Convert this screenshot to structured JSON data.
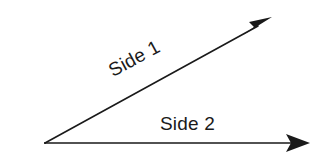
{
  "figure": {
    "type": "geometry-diagram",
    "background_color": "#ffffff",
    "stroke_color": "#1a1a1a",
    "text_color": "#1a1a1a"
  },
  "labels": {
    "side_1": "Side 1",
    "side_2": "Side 2"
  },
  "geometry": {
    "vertex": {
      "x": 45,
      "y": 143
    },
    "rays": [
      {
        "name": "upper-ray",
        "label": "Side 1",
        "from": {
          "x": 45,
          "y": 143
        },
        "to": {
          "x": 272,
          "y": 18
        },
        "angle_degrees": 28.5,
        "arrowhead": "filled-triangle"
      },
      {
        "name": "lower-ray",
        "label": "Side 2",
        "from": {
          "x": 45,
          "y": 143
        },
        "to": {
          "x": 310,
          "y": 143
        },
        "angle_degrees": 0,
        "arrowhead": "filled-triangle"
      }
    ]
  }
}
